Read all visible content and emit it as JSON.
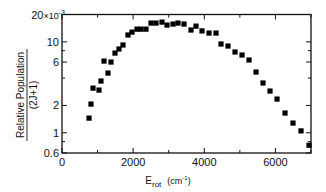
{
  "chart_data": {
    "type": "scatter",
    "title": "",
    "xlabel": "E_rot (cm^-1)",
    "xlabel_main": "E",
    "xlabel_sub": "rot",
    "xlabel_unit": "(cm",
    "xlabel_unit_sup": "-1",
    "xlabel_unit_close": ")",
    "ylabel": "Relative Population / (2J+1)",
    "ylabel_numerator": "Relative Population",
    "ylabel_denominator": "(2J+1)",
    "xlim": [
      0,
      7000
    ],
    "ylim": [
      0.6,
      20
    ],
    "yscale": "log",
    "y_multiplier_label": "×10",
    "y_multiplier_exp": "-3",
    "x_ticks_major": [
      0,
      2000,
      4000,
      6000
    ],
    "x_ticks_minor": [
      1000,
      3000,
      5000,
      7000
    ],
    "y_ticks_labeled": [
      {
        "value": 20,
        "label": "20"
      },
      {
        "value": 10,
        "label": "10"
      },
      {
        "value": 6,
        "label": "6"
      },
      {
        "value": 2,
        "label": "2"
      },
      {
        "value": 1,
        "label": "1"
      },
      {
        "value": 0.6,
        "label": "0.6"
      }
    ],
    "y_ticks_minor": [
      8,
      4,
      0.8
    ],
    "grid": false,
    "legend": null,
    "series": [
      {
        "name": "Relative Population/(2J+1)",
        "marker": "square",
        "color": "#000000",
        "x": [
          760,
          815,
          872,
          1040,
          1096,
          1181,
          1293,
          1378,
          1490,
          1602,
          1715,
          1855,
          1968,
          2108,
          2221,
          2362,
          2502,
          2643,
          2811,
          2952,
          3121,
          3261,
          3430,
          3627,
          3767,
          3936,
          4133,
          4330,
          4470,
          4667,
          4864,
          5061,
          5258,
          5455,
          5651,
          5848,
          6045,
          6270,
          6494,
          6719,
          6944
        ],
        "values": [
          1.45,
          2.07,
          3.1,
          2.95,
          3.71,
          6.15,
          4.54,
          6.0,
          7.53,
          8.35,
          9.24,
          11.9,
          12.8,
          13.8,
          13.8,
          13.8,
          16.1,
          16.1,
          16.5,
          15.3,
          15.7,
          16.1,
          15.7,
          13.5,
          14.9,
          13.2,
          12.5,
          12.5,
          9.47,
          9.0,
          7.74,
          7.17,
          6.32,
          4.66,
          3.53,
          2.88,
          2.35,
          1.65,
          1.28,
          1.05,
          0.73
        ]
      }
    ]
  }
}
